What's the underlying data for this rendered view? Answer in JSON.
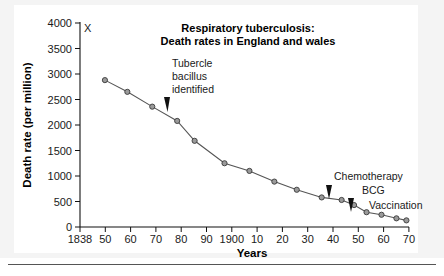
{
  "figure": {
    "corner_marker": "X",
    "background_color": "#f4f4f4",
    "panel_color": "#ffffff",
    "line_color": "#555555",
    "marker_color": "#9a9a9a"
  },
  "chart_data": {
    "type": "line",
    "title": "Respiratory tuberculosis:\nDeath rates in England and wales",
    "title_line1": "Respiratory tuberculosis:",
    "title_line2": "Death rates in England and wales",
    "xlabel": "Years",
    "ylabel": "Death rate (per million)",
    "ylim": [
      0,
      4000
    ],
    "xlim": [
      1838,
      1970
    ],
    "grid": false,
    "legend": "none",
    "ytick_labels": [
      "0",
      "500",
      "1000",
      "1500",
      "2000",
      "2500",
      "3000",
      "3500",
      "4000"
    ],
    "ytick_values": [
      0,
      500,
      1000,
      1500,
      2000,
      2500,
      3000,
      3500,
      4000
    ],
    "xtick_labels": [
      "1838",
      "50",
      "60",
      "70",
      "80",
      "90",
      "1900",
      "10",
      "20",
      "30",
      "40",
      "50",
      "60",
      "70"
    ],
    "xtick_values": [
      1838,
      1850,
      1860,
      1870,
      1880,
      1890,
      1900,
      1910,
      1920,
      1930,
      1940,
      1950,
      1960,
      1970
    ],
    "x": [
      1848,
      1857,
      1867,
      1877,
      1884,
      1896,
      1906,
      1916,
      1925,
      1935,
      1943,
      1948,
      1953,
      1959,
      1965,
      1969
    ],
    "values": [
      2880,
      2650,
      2360,
      2080,
      1690,
      1250,
      1100,
      890,
      730,
      580,
      530,
      430,
      290,
      240,
      170,
      130
    ],
    "points": [
      {
        "year": 1848,
        "rate": 2880
      },
      {
        "year": 1857,
        "rate": 2650
      },
      {
        "year": 1867,
        "rate": 2360
      },
      {
        "year": 1877,
        "rate": 2080
      },
      {
        "year": 1884,
        "rate": 1690
      },
      {
        "year": 1896,
        "rate": 1250
      },
      {
        "year": 1906,
        "rate": 1100
      },
      {
        "year": 1916,
        "rate": 890
      },
      {
        "year": 1925,
        "rate": 730
      },
      {
        "year": 1935,
        "rate": 580
      },
      {
        "year": 1943,
        "rate": 530
      },
      {
        "year": 1948,
        "rate": 430
      },
      {
        "year": 1953,
        "rate": 290
      },
      {
        "year": 1959,
        "rate": 240
      },
      {
        "year": 1965,
        "rate": 170
      },
      {
        "year": 1969,
        "rate": 130
      }
    ],
    "annotations": [
      {
        "id": "tubercle",
        "line1": "Tubercle",
        "line2": "bacillus",
        "line3": "identified",
        "marker_year": 1882
      },
      {
        "id": "chemotherapy",
        "text": "Chemotherapy",
        "marker_year": 1947
      },
      {
        "id": "bcg",
        "text": "BCG",
        "marker_year": 1955
      },
      {
        "id": "vaccination",
        "text": "Vaccination"
      }
    ]
  },
  "annotation_text": {
    "tubercle_l1": "Tubercle",
    "tubercle_l2": "bacillus",
    "tubercle_l3": "identified",
    "chemotherapy": "Chemotherapy",
    "bcg": "BCG",
    "vaccination": "Vaccination"
  }
}
